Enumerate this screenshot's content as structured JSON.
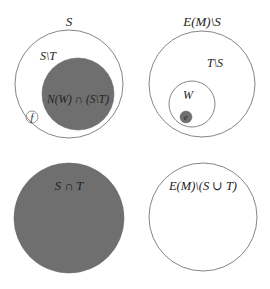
{
  "diagram": {
    "colors": {
      "background": "#ffffff",
      "stroke": "#777777",
      "fill_dark": "#6f6f6f",
      "text": "#222222"
    },
    "panels": {
      "top_left": {
        "outer_label": "S",
        "inner_region_label": "S\\T",
        "dark_label": "N(W) ∩ (S\\T)",
        "small_circle_label": "f"
      },
      "top_right": {
        "outer_label": "E(M)\\S",
        "inner_region_label": "T\\S",
        "sub_circle_label": "W",
        "dot_label": "e"
      },
      "bottom_left": {
        "label": "S ∩ T"
      },
      "bottom_right": {
        "label": "E(M)\\(S ∪ T)"
      }
    }
  }
}
